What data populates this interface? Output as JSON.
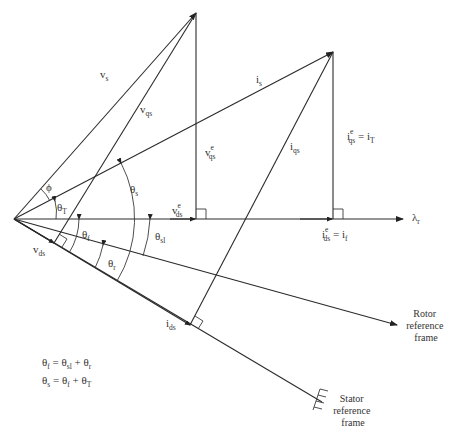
{
  "diagram": {
    "vectors": {
      "vs": {
        "base": "v",
        "sub": "s"
      },
      "vqs": {
        "base": "v",
        "sub": "qs"
      },
      "vqse": {
        "base": "v",
        "sub": "qs",
        "sup": "e"
      },
      "vdse": {
        "base": "v",
        "sub": "ds",
        "sup": "e"
      },
      "vds": {
        "base": "v",
        "sub": "ds"
      },
      "is": {
        "base": "i",
        "sub": "s"
      },
      "iqs": {
        "base": "i",
        "sub": "qs"
      },
      "ids": {
        "base": "i",
        "sub": "ds"
      },
      "iqse": {
        "base": "i",
        "sub": "qs",
        "sup": "e",
        "eq": "= i",
        "eqsub": "T"
      },
      "idse": {
        "base": "i",
        "sub": "ds",
        "sup": "e",
        "eq": "= i",
        "eqsub": "f"
      },
      "lambda": {
        "base": "λ",
        "sub": "r"
      }
    },
    "angles": {
      "phi": "ϕ",
      "thetaT": {
        "base": "θ",
        "sub": "T"
      },
      "thetaS": {
        "base": "θ",
        "sub": "s"
      },
      "thetaF": {
        "base": "θ",
        "sub": "f"
      },
      "thetaSl": {
        "base": "θ",
        "sub": "sl"
      },
      "thetaR": {
        "base": "θ",
        "sub": "r"
      }
    },
    "frames": {
      "rotor": [
        "Rotor",
        "reference",
        "frame"
      ],
      "stator": [
        "Stator",
        "reference",
        "frame"
      ]
    },
    "equations": [
      {
        "lhs": "θ",
        "lhs_sub": "f",
        "mid": " = θ",
        "mid_sub": "sl",
        "rest": " + θ",
        "rest_sub": "r"
      },
      {
        "lhs": "θ",
        "lhs_sub": "s",
        "mid": " = θ",
        "mid_sub": "f",
        "rest": " + θ",
        "rest_sub": "T"
      }
    ]
  }
}
